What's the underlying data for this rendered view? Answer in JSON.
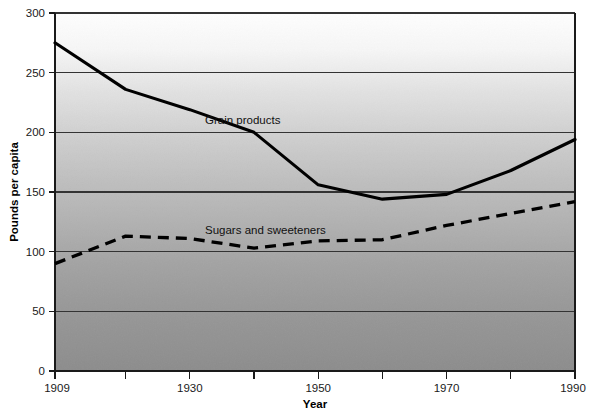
{
  "figure": {
    "caption": ""
  },
  "axes": {
    "y_title": "Pounds per capita",
    "x_title": "Year",
    "y_ticks": [
      "0",
      "50",
      "100",
      "150",
      "200",
      "250",
      "300"
    ],
    "x_ticks": [
      "1909",
      "1930",
      "1950",
      "1970",
      "1990"
    ]
  },
  "series_labels": {
    "grain": "Grain products",
    "sugars": "Sugars and sweeteners"
  },
  "colors": {
    "line": "#000000",
    "grid": "#3a3a3a",
    "plot_bg_top": "#fdfdfd",
    "plot_bg_bottom": "#8d8d8d",
    "text": "#1a1a1a"
  },
  "chart_data": {
    "type": "line",
    "title": "",
    "subtitle": "",
    "xlabel": "Year",
    "ylabel": "Pounds per capita",
    "xlim": [
      1909,
      1990
    ],
    "ylim": [
      0,
      300
    ],
    "grid": true,
    "grid_axis": "y",
    "legend_position": "inline-annotations",
    "x_tick_labels": [
      "1909",
      "1930",
      "1950",
      "1970",
      "1990"
    ],
    "x_tick_values": [
      1909,
      1930,
      1950,
      1970,
      1990
    ],
    "x_minor_tick_values": [
      1920,
      1940,
      1960,
      1980
    ],
    "y_tick_values": [
      0,
      50,
      100,
      150,
      200,
      250,
      300
    ],
    "x": [
      1909,
      1920,
      1930,
      1940,
      1950,
      1960,
      1970,
      1980,
      1990
    ],
    "series": [
      {
        "name": "Grain products",
        "style": "solid",
        "color": "#000000",
        "values": [
          275,
          236,
          219,
          200,
          156,
          144,
          148,
          168,
          194
        ]
      },
      {
        "name": "Sugars and sweeteners",
        "style": "dashed",
        "color": "#000000",
        "values": [
          90,
          113,
          111,
          103,
          109,
          110,
          122,
          132,
          142
        ]
      }
    ],
    "annotations": [
      {
        "text": "Grain products",
        "x": 1936,
        "y": 209
      },
      {
        "text": "Sugars and sweeteners",
        "x": 1936,
        "y": 122
      }
    ]
  }
}
